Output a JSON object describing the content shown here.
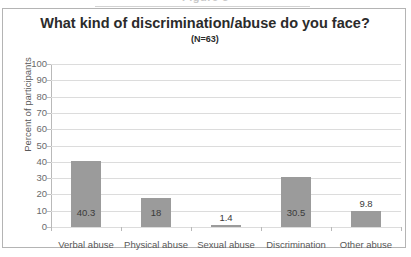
{
  "caption": {
    "text": "Figure 5"
  },
  "chart_data": {
    "type": "bar",
    "title": "What kind of discrimination/abuse do you face?",
    "subtitle": "(N=63)",
    "xlabel": "",
    "ylabel": "Percent of participants",
    "categories": [
      "Verbal abuse",
      "Physical abuse",
      "Sexual abuse",
      "Discrimination",
      "Other abuse"
    ],
    "values": [
      40.3,
      18,
      1.4,
      30.5,
      9.8
    ],
    "value_labels": [
      "40.3",
      "18",
      "1.4",
      "30.5",
      "9.8"
    ],
    "ylim": [
      0,
      100
    ],
    "ytick_labels": [
      "100",
      "90",
      "80",
      "70",
      "60",
      "50",
      "40",
      "30",
      "20",
      "10",
      "0"
    ],
    "ytick_values": [
      100,
      90,
      80,
      70,
      60,
      50,
      40,
      30,
      20,
      10,
      0
    ],
    "grid": "horizontal",
    "legend": "none",
    "bar_color": "#9b9b9b",
    "gridline_color": "#dcdcdc",
    "axis_color": "#b9b9b9",
    "title_color": "#2b2b2b",
    "tick_label_color": "#6b6b6b",
    "frame_color": "#b4b4b4",
    "background_color": "#ffffff"
  }
}
